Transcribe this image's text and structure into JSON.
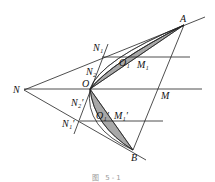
{
  "figure": {
    "caption": "图 5-1",
    "points": {
      "A": {
        "label": "A",
        "x": 184,
        "y": 25
      },
      "B": {
        "label": "B",
        "x": 133,
        "y": 150
      },
      "N": {
        "label": "N",
        "x": 24,
        "y": 90
      },
      "O": {
        "label": "O",
        "x": 90,
        "y": 89
      },
      "M": {
        "label": "M",
        "x": 160,
        "y": 90
      },
      "N1": {
        "label": "N₁",
        "x": 103,
        "y": 57
      },
      "N2": {
        "label": "N₂",
        "x": 97,
        "y": 74
      },
      "O1": {
        "label": "O₁",
        "x": 120,
        "y": 57
      },
      "M1": {
        "label": "M₁",
        "x": 137,
        "y": 57
      },
      "N2p": {
        "label": "N₂′",
        "x": 84,
        "y": 104
      },
      "N1p": {
        "label": "N₁′",
        "x": 78,
        "y": 122
      },
      "O1p": {
        "label": "O₁′",
        "x": 96,
        "y": 120
      },
      "M1p": {
        "label": "M₁′",
        "x": 113,
        "y": 120
      }
    }
  }
}
